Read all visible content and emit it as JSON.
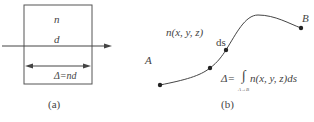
{
  "panel_a": {
    "label_n": "n",
    "label_d": "d",
    "label_delta": "Δ=nd",
    "caption": "(a)"
  },
  "panel_b": {
    "label_n_xyz": "n(x, y, z)",
    "label_A": "A",
    "label_B": "B",
    "label_ds": "ds",
    "formula_lhs": "Δ=",
    "integral_sign": "∫",
    "integral_limits": "A→B",
    "formula_rhs": "n(x, y, z)ds",
    "caption": "(b)"
  }
}
